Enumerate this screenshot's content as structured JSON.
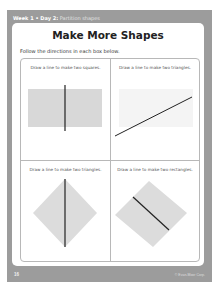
{
  "header": {
    "week_day": "Week 1 • Day 2:",
    "topic": "Partition shapes"
  },
  "title": "Make More Shapes",
  "instructions": "Follow the directions in each box below.",
  "boxes": [
    {
      "label": "Draw a line to make two squares.",
      "shape": "rectangle",
      "line": "vertical"
    },
    {
      "label": "Draw a line to make two triangles.",
      "shape": "rectangle-faint",
      "line": "diagonal"
    },
    {
      "label": "Draw a line to make two triangles.",
      "shape": "diamond",
      "line": "vertical"
    },
    {
      "label": "Draw a line to make two rectangles.",
      "shape": "tilted-square",
      "line": "diagonal"
    }
  ],
  "footer": {
    "page_number": "16",
    "credit": "© Evan-Moor Corp."
  },
  "colors": {
    "frame": "#9c9c9c",
    "shape_fill": "#dcdcdc",
    "line": "#222222"
  }
}
